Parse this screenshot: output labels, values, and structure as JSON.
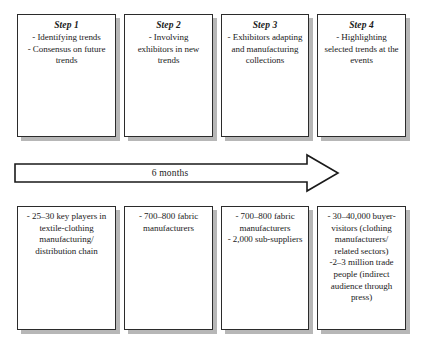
{
  "diagram": {
    "colors": {
      "box_border": "#2b2b2b",
      "box_fill": "#ffffff",
      "shadow": "#b7b7b7",
      "text": "#1a1a1a",
      "arrow_stroke": "#1a1a1a",
      "arrow_fill": "#ffffff",
      "background": "#ffffff"
    },
    "timeline": {
      "label": "6 months",
      "direction": "left-to-right",
      "shape": "block-arrow"
    },
    "steps": [
      {
        "title": "Step 1",
        "body": "- Identifying trends\n- Consensus on future trends",
        "detail": "- 25–30 key players in textile-clothing manufacturing/ distribution chain"
      },
      {
        "title": "Step 2",
        "body": "- Involving exhibitors in new trends",
        "detail": "- 700–800 fabric manufacturers"
      },
      {
        "title": "Step 3",
        "body": "- Exhibitors adapting and manufacturing collections",
        "detail": "- 700–800 fabric manufacturers\n- 2,000 sub-suppliers"
      },
      {
        "title": "Step 4",
        "body": "- Highlighting selected trends at the events",
        "detail": "- 30–40,000 buyer-visitors (clothing manufacturers/ related sectors)\n-2–3 million trade people (indirect audience through press)"
      }
    ]
  }
}
